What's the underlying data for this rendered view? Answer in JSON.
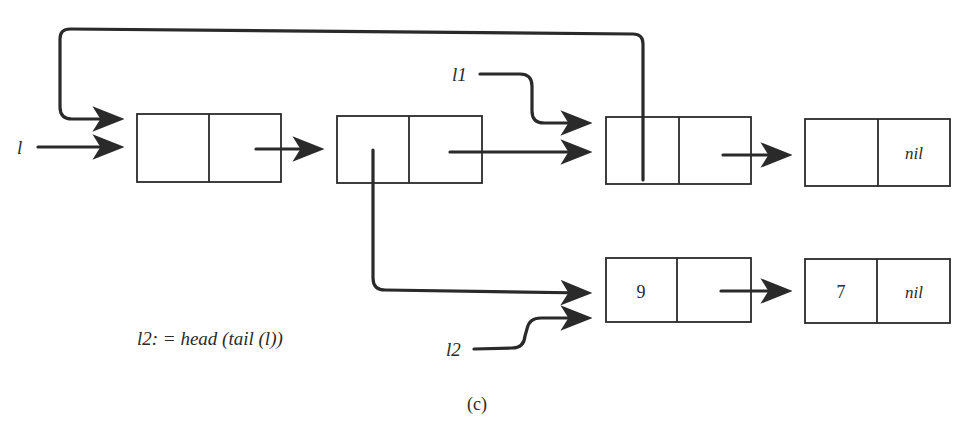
{
  "diagram": {
    "type": "linked-list",
    "caption": "(c)",
    "statement": "l2: = head (tail (l))",
    "variables": [
      {
        "name": "l",
        "label": "l"
      },
      {
        "name": "l1",
        "label": "l1"
      },
      {
        "name": "l2",
        "label": "l2"
      }
    ],
    "cells": [
      {
        "id": "c1",
        "head": "",
        "tail": "ptr"
      },
      {
        "id": "c2",
        "head": "ptr",
        "tail": "ptr"
      },
      {
        "id": "c3",
        "head": "ptr",
        "tail": "ptr"
      },
      {
        "id": "c4",
        "head": "",
        "tail": "nil"
      },
      {
        "id": "c5",
        "head": "9",
        "tail": "ptr"
      },
      {
        "id": "c6",
        "head": "7",
        "tail": "nil"
      }
    ],
    "labels": {
      "nil": "nil",
      "nine": "9",
      "seven": "7"
    }
  }
}
